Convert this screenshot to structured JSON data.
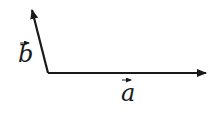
{
  "diagram": {
    "type": "vector-diagram",
    "origin": [
      48,
      73
    ],
    "vectors": [
      {
        "name": "a",
        "label": "a",
        "from": [
          48,
          73
        ],
        "to": [
          206,
          73
        ],
        "label_pos": [
          128,
          101
        ],
        "color": "#1a1a1a"
      },
      {
        "name": "b",
        "label": "b",
        "from": [
          48,
          73
        ],
        "to": [
          32,
          10
        ],
        "label_pos": [
          26,
          62
        ],
        "color": "#1a1a1a"
      }
    ]
  }
}
